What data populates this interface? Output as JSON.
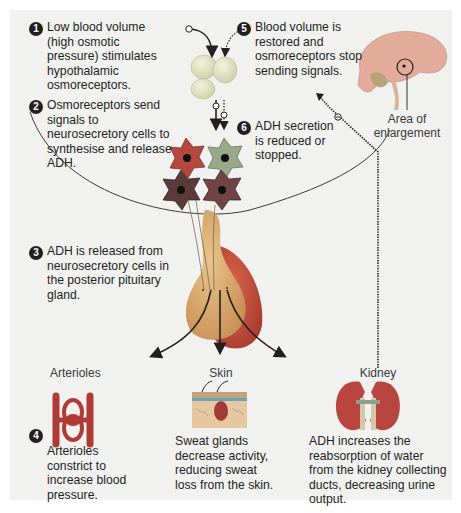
{
  "diagram": {
    "steps": [
      {
        "number": "1",
        "text": "Low blood volume (high osmotic pressure) stimulates hypothalamic osmoreceptors."
      },
      {
        "number": "2",
        "text": "Osmoreceptors send signals to neurosecretory cells to synthesise and release ADH."
      },
      {
        "number": "3",
        "text": "ADH is released from neurosecretory cells in the posterior pituitary gland."
      },
      {
        "number": "4",
        "text": "Arterioles constrict to increase blood pressure."
      },
      {
        "number": "5",
        "text": "Blood volume is restored and osmoreceptors stop sending signals."
      },
      {
        "number": "6",
        "text": "ADH secretion is reduced or stopped."
      }
    ],
    "brain_label": "Area of enlargement",
    "targets": [
      {
        "name": "Arterioles",
        "text": "Arterioles constrict to increase blood pressure."
      },
      {
        "name": "Skin",
        "text": "Sweat glands decrease activity, reducing sweat loss from the skin."
      },
      {
        "name": "Kidney",
        "text": "ADH increases the reabsorption of water from the kidney collecting ducts, decreasing urine output."
      }
    ],
    "feedback_symbols": {
      "positive": "+",
      "negative": "−"
    },
    "colors": {
      "panel_bg": "#f1f1f0",
      "text": "#231f20",
      "cell_red": "#b5473d",
      "cell_green": "#9aa88a",
      "cell_dark": "#5a3a3a",
      "pituitary_anterior": "#c64f3c",
      "pituitary_posterior": "#d8a46a",
      "kidney": "#b8453e",
      "brain": "#e0a99a",
      "skin": "#c9a07a",
      "arteriole": "#b03a34"
    }
  }
}
